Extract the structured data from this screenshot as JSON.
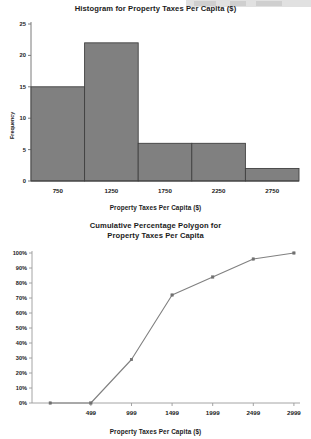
{
  "page": {
    "background_color": "#ffffff",
    "text_color": "#1b1b1b"
  },
  "toolbar_remnant": {
    "name": "partial-toolbar-strip",
    "visible": true
  },
  "charts": {
    "histogram": {
      "title": "Histogram for Property Taxes Per Capita ($)",
      "xlabel": "Property Taxes Per Capita ($)",
      "ylabel": "Frequency"
    },
    "polygon": {
      "title_line1": "Cumulative Percentage Polygon for",
      "title_line2": "Property Taxes Per Capita",
      "xlabel": "Property Taxes Per Capita ($)",
      "ylabel": ""
    }
  },
  "chart_data": [
    {
      "type": "bar",
      "title": "Histogram for Property Taxes Per Capita ($)",
      "xlabel": "Property Taxes Per Capita ($)",
      "ylabel": "Frequency",
      "categories": [
        "750",
        "1250",
        "1750",
        "2250",
        "2750"
      ],
      "values": [
        15,
        22,
        6,
        6,
        2
      ],
      "ylim": [
        0,
        25
      ],
      "yticks": [
        0,
        5,
        10,
        15,
        20,
        25
      ],
      "ytick_labels": [
        "0",
        "5",
        "10",
        "15",
        "20",
        "25"
      ],
      "xtick_labels": [
        "750",
        "1250",
        "1750",
        "2250",
        "2750"
      ],
      "bar_fill_color": "#808080",
      "bar_edge_color": "#404040",
      "bar_gap": 0,
      "grid": false,
      "legend": "none"
    },
    {
      "type": "line",
      "title": "Cumulative Percentage Polygon for Property Taxes Per Capita",
      "xlabel": "Property Taxes Per Capita ($)",
      "ylabel": "",
      "x": [
        "-1",
        "499",
        "999",
        "1499",
        "1999",
        "2499",
        "2999"
      ],
      "values": [
        0,
        0,
        29,
        72,
        84,
        96,
        100
      ],
      "value_labels": [
        "0%",
        "0%",
        "29%",
        "72%",
        "84%",
        "96%",
        "100%"
      ],
      "ylim": [
        0,
        100
      ],
      "yticks": [
        0,
        10,
        20,
        30,
        40,
        50,
        60,
        70,
        80,
        90,
        100
      ],
      "ytick_labels": [
        "0%",
        "10%",
        "20%",
        "30%",
        "40%",
        "50%",
        "60%",
        "70%",
        "80%",
        "90%",
        "100%"
      ],
      "xtick_labels": [
        "499",
        "999",
        "1499",
        "1999",
        "2499",
        "2999"
      ],
      "line_color": "#808080",
      "marker": "square",
      "marker_color": "#707070",
      "grid": false,
      "legend": "none"
    }
  ]
}
